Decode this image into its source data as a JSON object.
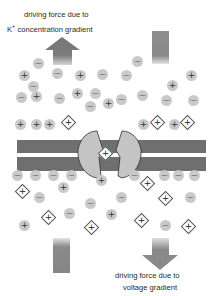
{
  "labels": {
    "top_line1": "driving force due to",
    "top_k": "K",
    "top_k_sup": "+",
    "top_line2": "concentration gradient",
    "bottom_line1": "driving force due to",
    "bottom_line2": "voltage gradient"
  },
  "symbols": {
    "plus": "+",
    "minus": "−"
  },
  "colors": {
    "membrane": "#6f6f6f",
    "channel": "#c4c4c4",
    "ion_fill": "#c9c9c9",
    "arrow": "#7a7a7a"
  },
  "ions": {
    "outside_plus": [
      [
        24,
        75
      ],
      [
        80,
        75
      ],
      [
        191,
        75
      ],
      [
        172,
        85
      ],
      [
        36,
        96
      ],
      [
        77,
        93
      ],
      [
        108,
        103
      ],
      [
        49,
        124
      ],
      [
        20,
        124
      ],
      [
        36,
        124
      ],
      [
        143,
        124
      ],
      [
        174,
        124
      ]
    ],
    "outside_minus": [
      [
        38,
        63
      ],
      [
        57,
        73
      ],
      [
        102,
        74
      ],
      [
        137,
        61
      ],
      [
        126,
        75
      ],
      [
        33,
        86
      ],
      [
        21,
        97
      ],
      [
        59,
        98
      ],
      [
        95,
        93
      ],
      [
        121,
        99
      ],
      [
        90,
        106
      ],
      [
        166,
        100
      ],
      [
        193,
        100
      ],
      [
        142,
        95
      ]
    ],
    "inside_plus": [
      [
        101,
        180
      ],
      [
        63,
        187
      ],
      [
        111,
        214
      ],
      [
        24,
        225
      ]
    ],
    "inside_minus": [
      [
        17,
        175
      ],
      [
        35,
        175
      ],
      [
        53,
        175
      ],
      [
        71,
        175
      ],
      [
        134,
        175
      ],
      [
        164,
        175
      ],
      [
        178,
        175
      ],
      [
        194,
        175
      ],
      [
        39,
        197
      ],
      [
        90,
        203
      ],
      [
        121,
        197
      ],
      [
        69,
        213
      ],
      [
        190,
        197
      ],
      [
        165,
        225
      ]
    ]
  },
  "k_ions": {
    "outside": [
      [
        68,
        122
      ],
      [
        157,
        122
      ],
      [
        187,
        122
      ]
    ],
    "channel": [
      [
        105,
        153
      ]
    ],
    "inside": [
      [
        147,
        183
      ],
      [
        22,
        191
      ],
      [
        165,
        198
      ],
      [
        48,
        217
      ],
      [
        91,
        227
      ],
      [
        141,
        220
      ],
      [
        188,
        226
      ]
    ]
  }
}
